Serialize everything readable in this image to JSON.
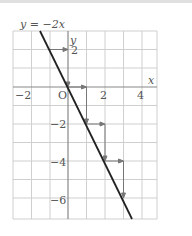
{
  "diagram": {
    "equation_label": "y = −2x",
    "axis_x_label": "x",
    "axis_y_label": "y",
    "origin_label": "O",
    "x_ticks": [
      {
        "value": -2,
        "label": "−2"
      },
      {
        "value": 2,
        "label": "2"
      },
      {
        "value": 4,
        "label": "4"
      }
    ],
    "y_ticks": [
      {
        "value": 2,
        "label": "2"
      },
      {
        "value": -2,
        "label": "−2"
      },
      {
        "value": -4,
        "label": "−4"
      },
      {
        "value": -6,
        "label": "−6"
      }
    ],
    "line": {
      "slope": -2,
      "intercept": 0
    },
    "step_arrows": [
      {
        "from": [
          -1,
          2
        ],
        "to": [
          0,
          2
        ],
        "then_to": [
          0,
          0
        ]
      },
      {
        "from": [
          0,
          0
        ],
        "to": [
          1,
          0
        ],
        "then_to": [
          1,
          -2
        ]
      },
      {
        "from": [
          1,
          -2
        ],
        "to": [
          2,
          -2
        ],
        "then_to": [
          2,
          -4
        ]
      },
      {
        "from": [
          2,
          -4
        ],
        "to": [
          3,
          -4
        ],
        "then_to": [
          3,
          -6
        ]
      }
    ],
    "colors": {
      "grid": "#cfcfcf",
      "axis": "#888888",
      "line": "#222222",
      "arrow": "#777777"
    }
  }
}
